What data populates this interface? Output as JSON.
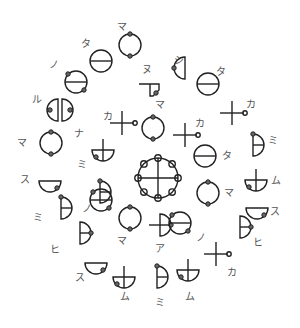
{
  "diagram": {
    "center": {
      "x": 158,
      "y": 178,
      "name": "hub-symbol",
      "type": "hub"
    },
    "symbols": [
      {
        "label": "マ",
        "type": "ring-2dot-v",
        "x": 130,
        "y": 45,
        "lx": 122,
        "ly": 27
      },
      {
        "label": "タ",
        "type": "circle-hline",
        "x": 101,
        "y": 61,
        "lx": 86,
        "ly": 44
      },
      {
        "label": "ノ",
        "type": "circle-hline-2dot",
        "x": 76,
        "y": 82,
        "lx": 54,
        "ly": 65
      },
      {
        "label": "ル",
        "type": "circle-vsplit",
        "x": 60,
        "y": 110,
        "lx": 37,
        "ly": 100
      },
      {
        "label": "マ",
        "type": "ring-2dot-v",
        "x": 51,
        "y": 143,
        "lx": 22,
        "ly": 143
      },
      {
        "label": "ス",
        "type": "half-down-dot",
        "x": 50,
        "y": 181,
        "lx": 25,
        "ly": 180
      },
      {
        "label": "ミ",
        "type": "half-right-hline",
        "x": 61,
        "y": 208,
        "lx": 38,
        "ly": 218
      },
      {
        "label": "ヒ",
        "type": "half-right-hline-dot",
        "x": 80,
        "y": 233,
        "lx": 55,
        "ly": 250
      },
      {
        "label": "ス",
        "type": "half-down-dot",
        "x": 96,
        "y": 263,
        "lx": 80,
        "ly": 278
      },
      {
        "label": "ム",
        "type": "half-down-vline-dot",
        "x": 124,
        "y": 277,
        "lx": 125,
        "ly": 297
      },
      {
        "label": "ミ",
        "type": "half-right-hline",
        "x": 157,
        "y": 277,
        "lx": 160,
        "ly": 303
      },
      {
        "label": "ム",
        "type": "half-down-vline-dot",
        "x": 188,
        "y": 270,
        "lx": 190,
        "ly": 297
      },
      {
        "label": "カ",
        "type": "cross-dot",
        "x": 216,
        "y": 254,
        "lx": 232,
        "ly": 273
      },
      {
        "label": "ヒ",
        "type": "half-right-hline-dot",
        "x": 240,
        "y": 227,
        "lx": 258,
        "ly": 243
      },
      {
        "label": "ス",
        "type": "half-down-dot",
        "x": 257,
        "y": 208,
        "lx": 275,
        "ly": 212
      },
      {
        "label": "ム",
        "type": "half-down-vline-dot",
        "x": 256,
        "y": 180,
        "lx": 276,
        "ly": 181
      },
      {
        "label": "ミ",
        "type": "half-right-hline",
        "x": 253,
        "y": 145,
        "lx": 273,
        "ly": 141
      },
      {
        "label": "カ",
        "type": "cross-dot",
        "x": 232,
        "y": 113,
        "lx": 251,
        "ly": 105
      },
      {
        "label": "タ",
        "type": "circle-hline",
        "x": 208,
        "y": 84,
        "lx": 221,
        "ly": 72
      },
      {
        "label": "シ",
        "type": "half-left-dot",
        "x": 181,
        "y": 68,
        "lx": 179,
        "ly": 61
      },
      {
        "label": "ヌ",
        "type": "step-dot",
        "x": 151,
        "y": 88,
        "lx": 147,
        "ly": 70
      },
      {
        "label": "カ",
        "type": "cross-dot",
        "x": 122,
        "y": 123,
        "lx": 108,
        "ly": 117
      },
      {
        "label": "ナ",
        "type": "half-down-vline-dot",
        "x": 103,
        "y": 150,
        "lx": 79,
        "ly": 134
      },
      {
        "label": "ミ",
        "type": "half-right-hline",
        "x": 100,
        "y": 192,
        "lx": 82,
        "ly": 165
      },
      {
        "label": "ノ",
        "type": "circle-hline-2dot",
        "x": 101,
        "y": 200,
        "lx": 87,
        "ly": 209
      },
      {
        "label": "マ",
        "type": "ring-2dot-v",
        "x": 130,
        "y": 218,
        "lx": 122,
        "ly": 241
      },
      {
        "label": "ア",
        "type": "half-right-vline-dot",
        "x": 160,
        "y": 225,
        "lx": 160,
        "ly": 249
      },
      {
        "label": "ノ",
        "type": "circle-hline-2dot",
        "x": 180,
        "y": 223,
        "lx": 201,
        "ly": 238
      },
      {
        "label": "マ",
        "type": "ring-2dot-v",
        "x": 208,
        "y": 193,
        "lx": 229,
        "ly": 193
      },
      {
        "label": "タ",
        "type": "circle-hline",
        "x": 205,
        "y": 156,
        "lx": 227,
        "ly": 156
      },
      {
        "label": "カ",
        "type": "cross-dot",
        "x": 185,
        "y": 135,
        "lx": 200,
        "ly": 124
      },
      {
        "label": "マ",
        "type": "ring-2dot-v",
        "x": 153,
        "y": 128,
        "lx": 160,
        "ly": 105
      }
    ]
  }
}
